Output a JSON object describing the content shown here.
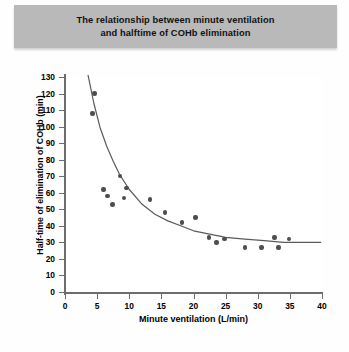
{
  "figure": {
    "title_line1": "The relationship between minute ventilation",
    "title_line2": "and halftime of COHb elimination",
    "title_band_color": "#b9b9b9",
    "point_color": "#4d4d52",
    "curve_color": "#5a5a5a",
    "axis_color": "#6d6d6d",
    "background_color": "#ffffff"
  },
  "chart_data": {
    "type": "scatter",
    "title": "The relationship between minute ventilation and halftime of COHb elimination",
    "xlabel": "Minute ventilation (L/min)",
    "ylabel": "Half-time of elimination of COHb (min)",
    "xlim": [
      0,
      40
    ],
    "ylim": [
      0,
      130
    ],
    "xticks": [
      0,
      5,
      10,
      15,
      20,
      25,
      30,
      35,
      40
    ],
    "yticks": [
      0,
      10,
      20,
      30,
      40,
      50,
      60,
      70,
      80,
      90,
      100,
      110,
      120,
      130
    ],
    "grid": false,
    "legend": "none",
    "series": [
      {
        "name": "Subjects",
        "marker": "filled-circle",
        "points": [
          {
            "x": 4.6,
            "y": 120
          },
          {
            "x": 4.3,
            "y": 108
          },
          {
            "x": 6.0,
            "y": 62
          },
          {
            "x": 6.6,
            "y": 58
          },
          {
            "x": 7.4,
            "y": 53
          },
          {
            "x": 8.6,
            "y": 70
          },
          {
            "x": 9.6,
            "y": 63
          },
          {
            "x": 9.2,
            "y": 57
          },
          {
            "x": 13.2,
            "y": 56
          },
          {
            "x": 15.6,
            "y": 48
          },
          {
            "x": 18.2,
            "y": 42
          },
          {
            "x": 20.3,
            "y": 45
          },
          {
            "x": 22.4,
            "y": 33
          },
          {
            "x": 23.6,
            "y": 30
          },
          {
            "x": 24.8,
            "y": 32
          },
          {
            "x": 28.0,
            "y": 27
          },
          {
            "x": 30.6,
            "y": 27
          },
          {
            "x": 32.6,
            "y": 33
          },
          {
            "x": 33.2,
            "y": 27
          },
          {
            "x": 34.9,
            "y": 32
          }
        ]
      },
      {
        "name": "Fitted decay curve",
        "marker": "line",
        "description": "Monotonic decreasing fit approaching an asymptote near 30 min",
        "points": [
          {
            "x": 3.6,
            "y": 131
          },
          {
            "x": 4.5,
            "y": 114
          },
          {
            "x": 5.5,
            "y": 99
          },
          {
            "x": 6.5,
            "y": 88
          },
          {
            "x": 7.5,
            "y": 79
          },
          {
            "x": 8.5,
            "y": 71
          },
          {
            "x": 10.0,
            "y": 62
          },
          {
            "x": 12.0,
            "y": 53
          },
          {
            "x": 14.0,
            "y": 47
          },
          {
            "x": 16.0,
            "y": 43
          },
          {
            "x": 18.0,
            "y": 40
          },
          {
            "x": 20.0,
            "y": 37
          },
          {
            "x": 22.5,
            "y": 35
          },
          {
            "x": 25.0,
            "y": 33
          },
          {
            "x": 28.0,
            "y": 32
          },
          {
            "x": 31.0,
            "y": 31
          },
          {
            "x": 34.0,
            "y": 30
          },
          {
            "x": 37.0,
            "y": 30
          },
          {
            "x": 39.8,
            "y": 30
          }
        ]
      }
    ]
  }
}
